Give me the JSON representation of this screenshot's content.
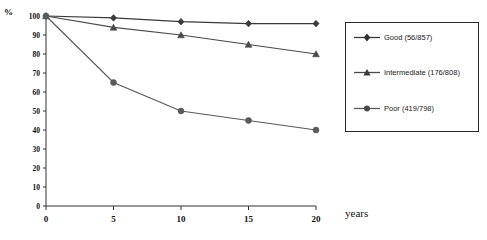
{
  "chart_data": {
    "type": "line",
    "title": "",
    "xlabel": "years",
    "ylabel": "%",
    "x": [
      0,
      5,
      10,
      15,
      20
    ],
    "xticklabels": [
      "0",
      "5",
      "10",
      "15",
      "20"
    ],
    "yticklabels": [
      "0",
      "10",
      "20",
      "30",
      "40",
      "50",
      "60",
      "70",
      "80",
      "90",
      "100"
    ],
    "xlim": [
      0,
      20
    ],
    "ylim": [
      0,
      100
    ],
    "grid": false,
    "legend_position": "right",
    "series": [
      {
        "name": "Good (56/857)",
        "marker": "diamond",
        "color": "#3a3a3a",
        "values": [
          100,
          99,
          97,
          96,
          96
        ]
      },
      {
        "name": "Intermediate (176/808)",
        "marker": "triangle",
        "color": "#4a4a4a",
        "values": [
          100,
          94,
          90,
          85,
          80
        ]
      },
      {
        "name": "Poor (419/798)",
        "marker": "circle",
        "color": "#5a5a5a",
        "values": [
          100,
          65,
          50,
          45,
          40
        ]
      }
    ]
  },
  "axes": {
    "y_axis_title": "%",
    "x_axis_title": "years"
  },
  "legend": {
    "entries": [
      {
        "label": "Good (56/857)"
      },
      {
        "label": "Intermediate (176/808)"
      },
      {
        "label": "Poor (419/798)"
      }
    ]
  },
  "title_crop": {
    "text": ""
  }
}
